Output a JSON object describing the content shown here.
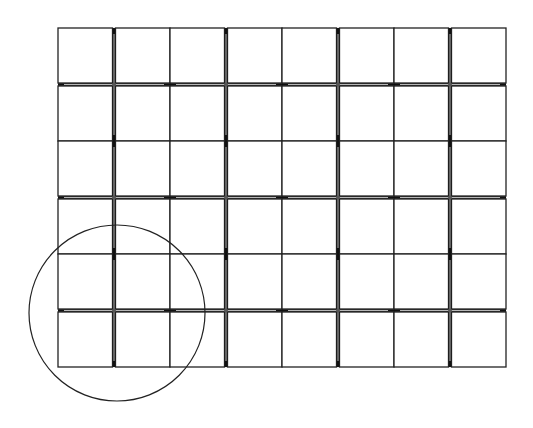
{
  "diagram": {
    "title": "Tile grid layout with highlighted corner module",
    "canvas": {
      "width": 533,
      "height": 428,
      "background": "#ffffff"
    },
    "grid": {
      "module_columns": 4,
      "module_rows": 3,
      "tiles_per_module": [
        2,
        2
      ],
      "origin": [
        58,
        28
      ],
      "module_size": [
        112,
        113
      ],
      "tile_gap": 3,
      "line_color": "#222222",
      "seam_color": "#111111"
    },
    "highlight": {
      "shape": "circle",
      "center": [
        117,
        313
      ],
      "radius": 88,
      "stroke": "#222222",
      "covers_module": {
        "column": 1,
        "row": 3
      }
    }
  }
}
